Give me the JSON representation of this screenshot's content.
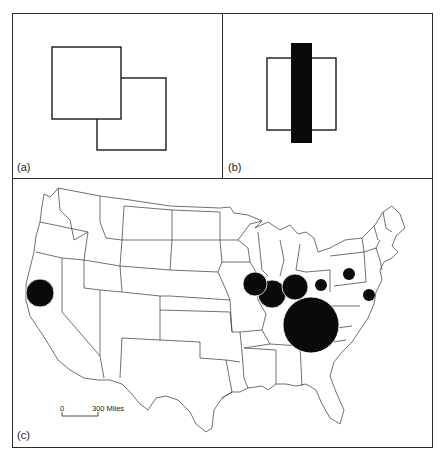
{
  "panels": {
    "a": {
      "label": "(a)",
      "description": "Two overlapping outlined squares"
    },
    "b": {
      "label": "(b)",
      "description": "Outlined square with a solid black vertical bar crossing it"
    },
    "c": {
      "label": "(c)",
      "description": "Outline map of the United States with proportional black circles"
    }
  },
  "map": {
    "scale_bar": {
      "zero_label": "0",
      "end_label": "300 Miles"
    },
    "symbols": [
      {
        "name": "california-circle",
        "cx": 40,
        "cy": 293,
        "r": 14
      },
      {
        "name": "iowa-illinois-circle",
        "cx": 255,
        "cy": 284,
        "r": 12
      },
      {
        "name": "illinois-circle",
        "cx": 272,
        "cy": 294,
        "r": 14
      },
      {
        "name": "indiana-circle",
        "cx": 295,
        "cy": 287,
        "r": 13
      },
      {
        "name": "kentucky-tennessee-circle",
        "cx": 311,
        "cy": 325,
        "r": 28
      },
      {
        "name": "ohio-circle",
        "cx": 321,
        "cy": 285,
        "r": 6
      },
      {
        "name": "pennsylvania-circle",
        "cx": 349,
        "cy": 274,
        "r": 6
      },
      {
        "name": "maryland-circle",
        "cx": 369,
        "cy": 295,
        "r": 6
      }
    ]
  },
  "colors": {
    "ink": "#111111",
    "line": "#2a2a2a",
    "paper": "#ffffff"
  }
}
